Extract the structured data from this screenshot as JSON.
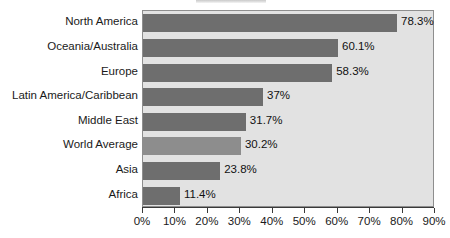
{
  "chart_data": {
    "type": "bar",
    "orientation": "horizontal",
    "title": "",
    "xlabel": "",
    "ylabel": "",
    "xlim": [
      0,
      90
    ],
    "grid": false,
    "legend": "none",
    "categories": [
      "North America",
      "Oceania/Australia",
      "Europe",
      "Latin America/Caribbean",
      "Middle East",
      "World Average",
      "Asia",
      "Africa"
    ],
    "values": [
      78.3,
      60.1,
      58.3,
      37,
      31.7,
      30.2,
      23.8,
      11.4
    ],
    "value_labels": [
      "78.3%",
      "60.1%",
      "58.3%",
      "37%",
      "31.7%",
      "30.2%",
      "23.8%",
      "11.4%"
    ],
    "highlighted_category": "World Average",
    "x_ticks": [
      0,
      10,
      20,
      30,
      40,
      50,
      60,
      70,
      80,
      90
    ],
    "x_tick_labels": [
      "0%",
      "10%",
      "20%",
      "30%",
      "40%",
      "50%",
      "60%",
      "70%",
      "80%",
      "90%"
    ],
    "colors": {
      "bar": "#6e6e6e",
      "bar_highlight": "#8d8d8d",
      "plot_background": "#e2e2e2",
      "plot_border": "#8e8e8e",
      "axis": "#3a3a3a",
      "text": "#1a1a1a",
      "page_background": "#ffffff"
    }
  }
}
